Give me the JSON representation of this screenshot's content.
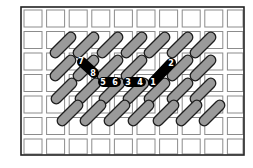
{
  "diagram": {
    "type": "needlepoint-stitch-diagram",
    "canvas": {
      "width": 253,
      "height": 168,
      "background": "#ffffff"
    },
    "frame": {
      "x": 21,
      "y": 7,
      "width": 223,
      "height": 148,
      "stroke": "#222222"
    },
    "grid": {
      "cols": 10,
      "rows": 7,
      "origin_x": 22,
      "origin_y": 8,
      "pitch_x": 22.6,
      "pitch_y": 21.5,
      "cell_w": 18,
      "cell_h": 17,
      "stroke": "#8c8c8c"
    },
    "colors": {
      "stitch_fill": "#9a9a9a",
      "stitch_outline": "#1e1e1e",
      "active_stitch": "#000000",
      "label_text": "#ffffff"
    },
    "stitch": {
      "length": 32,
      "thickness": 10,
      "angle": -45
    },
    "rows_of_stitches": [
      {
        "cy": 45,
        "cx": [
          63,
          86,
          110,
          134,
          157,
          180,
          203
        ]
      },
      {
        "cy": 68,
        "cx": [
          63,
          86,
          110,
          134,
          180,
          203
        ]
      },
      {
        "cy": 91,
        "cx": [
          64,
          88,
          112,
          136,
          157,
          180,
          203
        ]
      },
      {
        "cy": 113,
        "cx": [
          70,
          93,
          117,
          141,
          166,
          189,
          212
        ]
      }
    ],
    "active_stitches": [
      {
        "name": "stitch-1-2",
        "x1": 153,
        "y1": 82,
        "x2": 171,
        "y2": 63
      },
      {
        "name": "stitch-7-8",
        "x1": 82,
        "y1": 62,
        "x2": 94,
        "y2": 73
      },
      {
        "name": "stitch-5-6",
        "x1": 103,
        "y1": 82,
        "x2": 116,
        "y2": 82
      },
      {
        "name": "stitch-3-4",
        "x1": 128,
        "y1": 82,
        "x2": 141,
        "y2": 82
      }
    ],
    "labels": [
      {
        "text": "1",
        "x": 153,
        "y": 82
      },
      {
        "text": "2",
        "x": 171,
        "y": 63
      },
      {
        "text": "3",
        "x": 128,
        "y": 82
      },
      {
        "text": "4",
        "x": 140,
        "y": 82
      },
      {
        "text": "5",
        "x": 103,
        "y": 82
      },
      {
        "text": "6",
        "x": 115,
        "y": 82
      },
      {
        "text": "7",
        "x": 81,
        "y": 61
      },
      {
        "text": "8",
        "x": 93,
        "y": 73
      }
    ]
  }
}
